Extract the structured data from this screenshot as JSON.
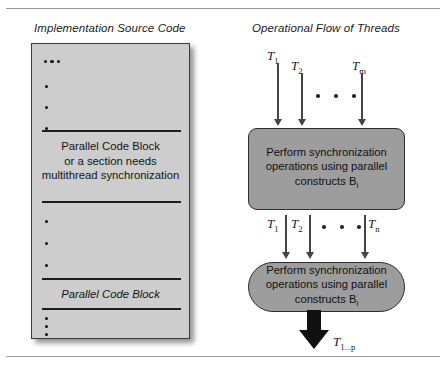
{
  "figure": {
    "background": "#ffffff",
    "rules": {
      "color": "#9a9a9a"
    }
  },
  "panels": {
    "left": {
      "title": "Implementation Source Code",
      "panel_fill": "#cdcdcd",
      "panel_border": "#3a3a3a",
      "blocks": [
        {
          "line1": "Parallel Code Block",
          "line2": "or a section needs",
          "line3": "multithread synchronization"
        }
      ],
      "italic_block": "Parallel Code Block"
    },
    "right": {
      "title": "Operational Flow of Threads",
      "box_fill": "#9d9d9d",
      "box_border": "#2e2e2e",
      "stage1": {
        "line1": "Perform synchronization",
        "line2": "operations using parallel",
        "line3_text": "constructs B",
        "line3_sub": "i"
      },
      "stage2": {
        "line1": "Perform synchronization",
        "line2": "operations using parallel",
        "line3_text": "constructs B",
        "line3_sub": "i"
      },
      "inputs_top": [
        {
          "base": "T",
          "sub": "1"
        },
        {
          "base": "T",
          "sub": "2"
        },
        {
          "base": "T",
          "sub": "m"
        }
      ],
      "inputs_mid": [
        {
          "base": "T",
          "sub": "1"
        },
        {
          "base": "T",
          "sub": "2"
        },
        {
          "base": "T",
          "sub": "n"
        }
      ],
      "output": {
        "base": "T",
        "sub": "1...p"
      }
    }
  }
}
